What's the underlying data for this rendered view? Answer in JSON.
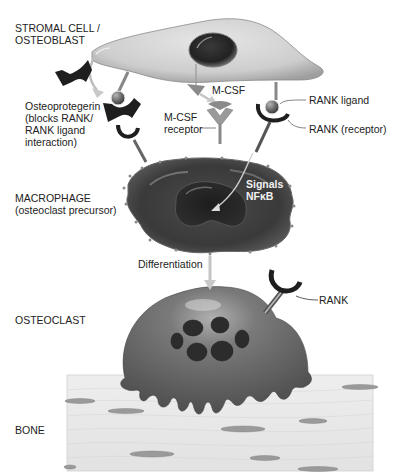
{
  "figure": {
    "palette": {
      "background": "#ffffff",
      "stromal_cell": "#d2d2d2",
      "nucleus_dark": "#2b2b2b",
      "macrophage": "#3e3e3e",
      "osteoclast": "#6e6e6e",
      "bone": "#ececec",
      "receptor_dark": "#1e1e1e",
      "ligand_ball": "#707070",
      "mcsf": "#8a8a8a",
      "arrow": "#bdbdbd"
    }
  },
  "labels": {
    "stromal_line1": "STROMAL CELL /",
    "stromal_line2": "OSTEOBLAST",
    "opg_line1": "Osteoprotegerin",
    "opg_line2": "(blocks RANK/",
    "opg_line3": "RANK ligand",
    "opg_line4": "interaction)",
    "mcsf": "M-CSF",
    "mcsf_receptor_line1": "M-CSF",
    "mcsf_receptor_line2": "receptor",
    "rank_ligand": "RANK ligand",
    "rank_receptor": "RANK (receptor)",
    "signals": "Signals",
    "nfkb": "NFκB",
    "macrophage_line1": "MACROPHAGE",
    "macrophage_line2": "(osteoclast precursor)",
    "differentiation": "Differentiation",
    "osteoclast": "OSTEOCLAST",
    "rank": "RANK",
    "bone": "BONE"
  }
}
